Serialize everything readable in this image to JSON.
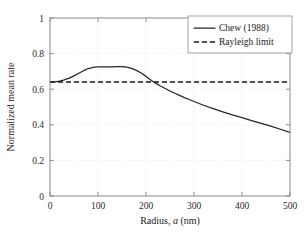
{
  "chart_data": {
    "type": "line",
    "title": "",
    "xlabel": "Radius, a (nm)",
    "xlabel_prefix": "Radius, ",
    "xlabel_italic": "a",
    "xlabel_suffix": " (nm)",
    "ylabel": "Normalized mean rate",
    "xlim": [
      0,
      500
    ],
    "ylim": [
      0,
      1
    ],
    "grid": true,
    "legend_position": "top-right",
    "xticks": [
      0,
      100,
      200,
      300,
      400,
      500
    ],
    "xtick_labels": [
      "0",
      "100",
      "200",
      "300",
      "400",
      "500"
    ],
    "yticks": [
      0,
      0.2,
      0.4,
      0.6,
      0.8,
      1
    ],
    "ytick_labels": [
      "0",
      "0.2",
      "0.4",
      "0.6",
      "0.8",
      "1"
    ],
    "series": [
      {
        "name": "Chew (1988)",
        "style": "solid",
        "color": "#262626",
        "x": [
          0,
          10,
          20,
          30,
          40,
          50,
          60,
          70,
          80,
          90,
          100,
          110,
          120,
          130,
          140,
          150,
          160,
          170,
          180,
          190,
          200,
          210,
          220,
          230,
          240,
          250,
          260,
          270,
          280,
          290,
          300,
          320,
          340,
          360,
          380,
          400,
          420,
          440,
          460,
          480,
          500
        ],
        "values": [
          0.64,
          0.641,
          0.645,
          0.652,
          0.662,
          0.675,
          0.69,
          0.704,
          0.716,
          0.723,
          0.726,
          0.726,
          0.726,
          0.726,
          0.727,
          0.727,
          0.724,
          0.717,
          0.706,
          0.691,
          0.672,
          0.652,
          0.634,
          0.618,
          0.604,
          0.59,
          0.577,
          0.565,
          0.553,
          0.542,
          0.531,
          0.51,
          0.491,
          0.473,
          0.456,
          0.44,
          0.424,
          0.408,
          0.392,
          0.375,
          0.358
        ]
      },
      {
        "name": "Rayleigh limit",
        "style": "dashed",
        "color": "#151515",
        "x": [
          0,
          500
        ],
        "values": [
          0.64,
          0.64
        ]
      }
    ],
    "annotations": {
      "crossing_radius_nm": 210,
      "peak_value": 0.727,
      "peak_radius_nm": 150,
      "start_value": 0.64,
      "end_value": 0.358,
      "rayleigh_level": 0.64
    }
  },
  "legend": {
    "entries": [
      {
        "label": "Chew (1988)",
        "style": "solid"
      },
      {
        "label": "Rayleigh limit",
        "style": "dashed"
      }
    ]
  }
}
